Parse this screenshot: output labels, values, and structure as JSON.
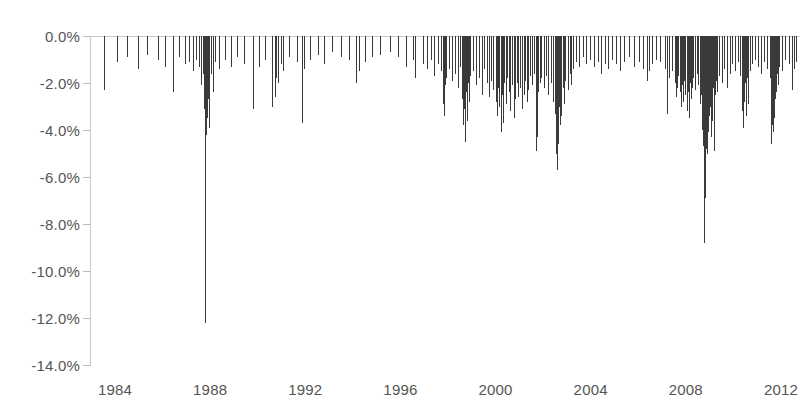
{
  "chart_data": {
    "type": "bar",
    "title": "",
    "subtitle": "",
    "xlabel": "",
    "ylabel": "",
    "grid": false,
    "legend": null,
    "legend_position": "none",
    "orientation": "downward-spikes",
    "series_color": "#3a3a3a",
    "axis_color": "#c9c9c9",
    "label_color": "#555555",
    "xlim": [
      1983.2,
      2012.8
    ],
    "ylim": [
      -14.0,
      0.0
    ],
    "xticks": [
      1984,
      1988,
      1992,
      1996,
      2000,
      2004,
      2008,
      2012
    ],
    "xtick_labels": [
      "1984",
      "1988",
      "1992",
      "1996",
      "2000",
      "2004",
      "2008",
      "2012"
    ],
    "yticks": [
      0.0,
      -2.0,
      -4.0,
      -6.0,
      -8.0,
      -10.0,
      -12.0,
      -14.0
    ],
    "ytick_labels": [
      "0.0%",
      "-2.0%",
      "-4.0%",
      "-6.0%",
      "-8.0%",
      "-10.0%",
      "-12.0%",
      "-14.0%"
    ],
    "units": "percent",
    "extremes": {
      "max_drawdown_value": -12.2,
      "max_drawdown_x": 1987.79,
      "second_max_value": -8.8,
      "second_max_x": 2008.77
    },
    "points": [
      [
        1983.55,
        -2.3
      ],
      [
        1984.08,
        -1.1
      ],
      [
        1984.52,
        -0.9
      ],
      [
        1984.96,
        -1.4
      ],
      [
        1985.35,
        -0.8
      ],
      [
        1985.82,
        -1.0
      ],
      [
        1986.12,
        -1.3
      ],
      [
        1986.44,
        -2.4
      ],
      [
        1986.7,
        -0.9
      ],
      [
        1986.93,
        -1.2
      ],
      [
        1987.1,
        -1.1
      ],
      [
        1987.26,
        -1.5
      ],
      [
        1987.41,
        -1.0
      ],
      [
        1987.55,
        -1.3
      ],
      [
        1987.62,
        -2.1
      ],
      [
        1987.68,
        -1.6
      ],
      [
        1987.72,
        -2.6
      ],
      [
        1987.75,
        -3.1
      ],
      [
        1987.77,
        -5.3
      ],
      [
        1987.79,
        -12.2
      ],
      [
        1987.81,
        -4.2
      ],
      [
        1987.83,
        -2.9
      ],
      [
        1987.85,
        -3.5
      ],
      [
        1987.87,
        -2.2
      ],
      [
        1987.9,
        -2.7
      ],
      [
        1987.93,
        -3.9
      ],
      [
        1987.96,
        -2.0
      ],
      [
        1988.02,
        -1.6
      ],
      [
        1988.1,
        -2.4
      ],
      [
        1988.21,
        -1.1
      ],
      [
        1988.38,
        -1.4
      ],
      [
        1988.62,
        -1.0
      ],
      [
        1988.89,
        -1.3
      ],
      [
        1989.14,
        -0.9
      ],
      [
        1989.42,
        -1.2
      ],
      [
        1989.78,
        -3.1
      ],
      [
        1989.82,
        -2.0
      ],
      [
        1990.05,
        -1.3
      ],
      [
        1990.31,
        -1.0
      ],
      [
        1990.58,
        -2.3
      ],
      [
        1990.62,
        -3.0
      ],
      [
        1990.71,
        -2.6
      ],
      [
        1990.78,
        -1.8
      ],
      [
        1990.85,
        -2.0
      ],
      [
        1990.96,
        -1.2
      ],
      [
        1991.08,
        -1.5
      ],
      [
        1991.33,
        -0.9
      ],
      [
        1991.65,
        -1.1
      ],
      [
        1991.86,
        -3.7
      ],
      [
        1991.95,
        -1.4
      ],
      [
        1992.18,
        -1.0
      ],
      [
        1992.52,
        -0.8
      ],
      [
        1992.79,
        -1.2
      ],
      [
        1993.12,
        -0.7
      ],
      [
        1993.48,
        -0.9
      ],
      [
        1993.85,
        -1.0
      ],
      [
        1994.12,
        -2.0
      ],
      [
        1994.27,
        -1.5
      ],
      [
        1994.53,
        -1.1
      ],
      [
        1994.82,
        -0.9
      ],
      [
        1995.14,
        -0.8
      ],
      [
        1995.56,
        -0.7
      ],
      [
        1995.91,
        -0.9
      ],
      [
        1996.22,
        -1.3
      ],
      [
        1996.52,
        -1.0
      ],
      [
        1996.61,
        -1.8
      ],
      [
        1996.95,
        -1.2
      ],
      [
        1997.13,
        -1.4
      ],
      [
        1997.28,
        -1.0
      ],
      [
        1997.42,
        -1.7
      ],
      [
        1997.58,
        -1.2
      ],
      [
        1997.71,
        -1.5
      ],
      [
        1997.8,
        -2.9
      ],
      [
        1997.83,
        -3.4
      ],
      [
        1997.88,
        -2.1
      ],
      [
        1997.92,
        -1.8
      ],
      [
        1998.04,
        -1.4
      ],
      [
        1998.18,
        -1.9
      ],
      [
        1998.3,
        -1.6
      ],
      [
        1998.42,
        -2.2
      ],
      [
        1998.51,
        -1.3
      ],
      [
        1998.6,
        -2.7
      ],
      [
        1998.64,
        -3.8
      ],
      [
        1998.67,
        -3.1
      ],
      [
        1998.7,
        -4.5
      ],
      [
        1998.73,
        -3.3
      ],
      [
        1998.76,
        -2.4
      ],
      [
        1998.79,
        -3.6
      ],
      [
        1998.83,
        -2.0
      ],
      [
        1998.87,
        -2.8
      ],
      [
        1998.92,
        -1.7
      ],
      [
        1999.05,
        -1.5
      ],
      [
        1999.18,
        -2.1
      ],
      [
        1999.31,
        -1.8
      ],
      [
        1999.42,
        -2.5
      ],
      [
        1999.52,
        -1.4
      ],
      [
        1999.63,
        -2.0
      ],
      [
        1999.74,
        -2.6
      ],
      [
        1999.82,
        -1.9
      ],
      [
        1999.9,
        -2.3
      ],
      [
        2000.02,
        -2.8
      ],
      [
        2000.06,
        -3.4
      ],
      [
        2000.1,
        -2.2
      ],
      [
        2000.15,
        -3.0
      ],
      [
        2000.22,
        -4.1
      ],
      [
        2000.26,
        -2.5
      ],
      [
        2000.3,
        -3.7
      ],
      [
        2000.36,
        -2.0
      ],
      [
        2000.42,
        -2.9
      ],
      [
        2000.48,
        -1.8
      ],
      [
        2000.55,
        -2.4
      ],
      [
        2000.62,
        -3.2
      ],
      [
        2000.7,
        -2.1
      ],
      [
        2000.77,
        -3.5
      ],
      [
        2000.82,
        -2.7
      ],
      [
        2000.88,
        -2.0
      ],
      [
        2000.94,
        -2.6
      ],
      [
        2001.03,
        -2.2
      ],
      [
        2001.12,
        -3.1
      ],
      [
        2001.18,
        -2.5
      ],
      [
        2001.24,
        -1.9
      ],
      [
        2001.31,
        -2.8
      ],
      [
        2001.38,
        -2.3
      ],
      [
        2001.45,
        -1.7
      ],
      [
        2001.52,
        -2.1
      ],
      [
        2001.6,
        -1.6
      ],
      [
        2001.71,
        -4.9
      ],
      [
        2001.73,
        -4.3
      ],
      [
        2001.76,
        -2.9
      ],
      [
        2001.8,
        -2.4
      ],
      [
        2001.86,
        -2.0
      ],
      [
        2001.93,
        -1.8
      ],
      [
        2002.02,
        -2.2
      ],
      [
        2002.11,
        -1.7
      ],
      [
        2002.22,
        -2.5
      ],
      [
        2002.31,
        -2.0
      ],
      [
        2002.42,
        -2.8
      ],
      [
        2002.48,
        -3.3
      ],
      [
        2002.53,
        -4.1
      ],
      [
        2002.56,
        -5.0
      ],
      [
        2002.58,
        -5.7
      ],
      [
        2002.61,
        -3.6
      ],
      [
        2002.64,
        -4.6
      ],
      [
        2002.67,
        -3.0
      ],
      [
        2002.7,
        -3.8
      ],
      [
        2002.73,
        -2.6
      ],
      [
        2002.77,
        -3.4
      ],
      [
        2002.82,
        -2.2
      ],
      [
        2002.88,
        -2.9
      ],
      [
        2002.94,
        -1.9
      ],
      [
        2003.05,
        -2.3
      ],
      [
        2003.12,
        -1.6
      ],
      [
        2003.18,
        -2.1
      ],
      [
        2003.26,
        -1.4
      ],
      [
        2003.38,
        -1.1
      ],
      [
        2003.52,
        -1.3
      ],
      [
        2003.68,
        -0.9
      ],
      [
        2003.82,
        -1.2
      ],
      [
        2003.95,
        -1.0
      ],
      [
        2004.12,
        -1.3
      ],
      [
        2004.31,
        -1.1
      ],
      [
        2004.43,
        -1.6
      ],
      [
        2004.58,
        -1.2
      ],
      [
        2004.72,
        -1.4
      ],
      [
        2004.88,
        -1.0
      ],
      [
        2005.08,
        -1.2
      ],
      [
        2005.24,
        -1.5
      ],
      [
        2005.41,
        -1.1
      ],
      [
        2005.62,
        -0.9
      ],
      [
        2005.82,
        -1.3
      ],
      [
        2006.02,
        -1.1
      ],
      [
        2006.21,
        -1.4
      ],
      [
        2006.38,
        -1.9
      ],
      [
        2006.44,
        -1.5
      ],
      [
        2006.58,
        -1.2
      ],
      [
        2006.75,
        -1.0
      ],
      [
        2006.92,
        -1.1
      ],
      [
        2007.12,
        -1.4
      ],
      [
        2007.2,
        -3.3
      ],
      [
        2007.28,
        -1.8
      ],
      [
        2007.42,
        -1.5
      ],
      [
        2007.55,
        -2.0
      ],
      [
        2007.6,
        -2.6
      ],
      [
        2007.63,
        -2.2
      ],
      [
        2007.68,
        -1.7
      ],
      [
        2007.75,
        -2.4
      ],
      [
        2007.8,
        -3.0
      ],
      [
        2007.84,
        -2.1
      ],
      [
        2007.88,
        -2.8
      ],
      [
        2007.93,
        -1.9
      ],
      [
        2007.97,
        -2.5
      ],
      [
        2008.03,
        -3.2
      ],
      [
        2008.07,
        -2.4
      ],
      [
        2008.12,
        -3.5
      ],
      [
        2008.16,
        -2.0
      ],
      [
        2008.21,
        -2.7
      ],
      [
        2008.26,
        -2.2
      ],
      [
        2008.31,
        -1.8
      ],
      [
        2008.38,
        -2.3
      ],
      [
        2008.45,
        -1.6
      ],
      [
        2008.52,
        -2.1
      ],
      [
        2008.58,
        -2.9
      ],
      [
        2008.62,
        -2.5
      ],
      [
        2008.66,
        -3.4
      ],
      [
        2008.7,
        -4.0
      ],
      [
        2008.72,
        -3.1
      ],
      [
        2008.74,
        -4.7
      ],
      [
        2008.75,
        -5.2
      ],
      [
        2008.76,
        -6.1
      ],
      [
        2008.77,
        -8.8
      ],
      [
        2008.78,
        -7.6
      ],
      [
        2008.79,
        -5.8
      ],
      [
        2008.8,
        -6.9
      ],
      [
        2008.81,
        -4.4
      ],
      [
        2008.82,
        -5.5
      ],
      [
        2008.83,
        -3.9
      ],
      [
        2008.84,
        -4.8
      ],
      [
        2008.85,
        -3.3
      ],
      [
        2008.86,
        -4.2
      ],
      [
        2008.87,
        -2.8
      ],
      [
        2008.88,
        -3.6
      ],
      [
        2008.9,
        -5.0
      ],
      [
        2008.91,
        -3.0
      ],
      [
        2008.92,
        -4.1
      ],
      [
        2008.94,
        -2.6
      ],
      [
        2008.96,
        -3.4
      ],
      [
        2008.98,
        -2.3
      ],
      [
        2009.02,
        -3.0
      ],
      [
        2009.05,
        -4.3
      ],
      [
        2009.08,
        -2.7
      ],
      [
        2009.11,
        -3.6
      ],
      [
        2009.14,
        -2.2
      ],
      [
        2009.17,
        -4.9
      ],
      [
        2009.19,
        -3.2
      ],
      [
        2009.22,
        -2.5
      ],
      [
        2009.26,
        -1.9
      ],
      [
        2009.32,
        -2.4
      ],
      [
        2009.41,
        -1.7
      ],
      [
        2009.52,
        -2.0
      ],
      [
        2009.62,
        -1.4
      ],
      [
        2009.74,
        -2.2
      ],
      [
        2009.85,
        -1.6
      ],
      [
        2009.95,
        -1.2
      ],
      [
        2010.08,
        -1.5
      ],
      [
        2010.18,
        -1.1
      ],
      [
        2010.28,
        -1.7
      ],
      [
        2010.35,
        -3.2
      ],
      [
        2010.38,
        -2.4
      ],
      [
        2010.42,
        -3.9
      ],
      [
        2010.45,
        -2.8
      ],
      [
        2010.48,
        -2.0
      ],
      [
        2010.52,
        -3.4
      ],
      [
        2010.55,
        -2.5
      ],
      [
        2010.58,
        -1.8
      ],
      [
        2010.62,
        -2.9
      ],
      [
        2010.68,
        -1.5
      ],
      [
        2010.78,
        -1.2
      ],
      [
        2010.9,
        -1.0
      ],
      [
        2011.05,
        -1.3
      ],
      [
        2011.18,
        -1.6
      ],
      [
        2011.28,
        -1.1
      ],
      [
        2011.4,
        -1.4
      ],
      [
        2011.52,
        -1.8
      ],
      [
        2011.58,
        -2.5
      ],
      [
        2011.6,
        -4.6
      ],
      [
        2011.61,
        -3.8
      ],
      [
        2011.63,
        -2.9
      ],
      [
        2011.65,
        -4.1
      ],
      [
        2011.67,
        -3.2
      ],
      [
        2011.69,
        -2.3
      ],
      [
        2011.71,
        -3.5
      ],
      [
        2011.73,
        -2.7
      ],
      [
        2011.76,
        -1.9
      ],
      [
        2011.8,
        -2.4
      ],
      [
        2011.84,
        -1.6
      ],
      [
        2011.88,
        -2.1
      ],
      [
        2011.93,
        -1.3
      ],
      [
        2012.05,
        -1.5
      ],
      [
        2012.18,
        -1.0
      ],
      [
        2012.32,
        -1.2
      ],
      [
        2012.45,
        -2.3
      ],
      [
        2012.55,
        -1.4
      ],
      [
        2012.65,
        -1.1
      ]
    ]
  }
}
